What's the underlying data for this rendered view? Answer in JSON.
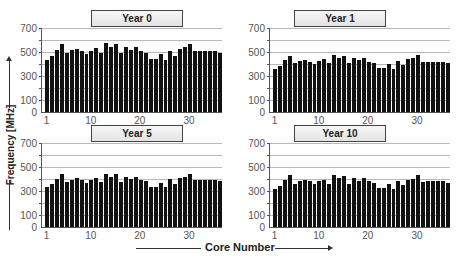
{
  "chart_data": [
    {
      "type": "bar",
      "title": "Year 0",
      "xlabel": "Core Number",
      "ylabel": "Frequency [MHz]",
      "ylim": [
        0,
        700
      ],
      "yticks": [
        0,
        100,
        300,
        500,
        700
      ],
      "xticks": [
        1,
        10,
        20,
        30
      ],
      "grid": true,
      "categories": [
        1,
        2,
        3,
        4,
        5,
        6,
        7,
        8,
        9,
        10,
        11,
        12,
        13,
        14,
        15,
        16,
        17,
        18,
        19,
        20,
        21,
        22,
        23,
        24,
        25,
        26,
        27,
        28,
        29,
        30,
        31,
        32,
        33,
        34,
        35,
        36
      ],
      "values": [
        430,
        465,
        520,
        570,
        490,
        515,
        525,
        505,
        485,
        510,
        530,
        490,
        575,
        540,
        565,
        490,
        545,
        515,
        545,
        505,
        495,
        440,
        440,
        480,
        435,
        510,
        470,
        525,
        540,
        570,
        505,
        510,
        505,
        505,
        510,
        495
      ]
    },
    {
      "type": "bar",
      "title": "Year 1",
      "xlabel": "Core Number",
      "ylabel": "Frequency [MHz]",
      "ylim": [
        0,
        700
      ],
      "yticks": [
        0,
        100,
        300,
        500,
        700
      ],
      "xticks": [
        1,
        10,
        20,
        30
      ],
      "grid": true,
      "categories": [
        1,
        2,
        3,
        4,
        5,
        6,
        7,
        8,
        9,
        10,
        11,
        12,
        13,
        14,
        15,
        16,
        17,
        18,
        19,
        20,
        21,
        22,
        23,
        24,
        25,
        26,
        27,
        28,
        29,
        30,
        31,
        32,
        33,
        34,
        35,
        36
      ],
      "values": [
        360,
        385,
        430,
        470,
        405,
        425,
        435,
        420,
        400,
        425,
        440,
        405,
        475,
        450,
        470,
        405,
        450,
        430,
        450,
        420,
        410,
        365,
        365,
        400,
        360,
        425,
        390,
        440,
        450,
        475,
        420,
        420,
        420,
        420,
        420,
        410
      ]
    },
    {
      "type": "bar",
      "title": "Year 5",
      "xlabel": "Core Number",
      "ylabel": "Frequency [MHz]",
      "ylim": [
        0,
        700
      ],
      "yticks": [
        0,
        100,
        300,
        500,
        700
      ],
      "xticks": [
        1,
        10,
        20,
        30
      ],
      "grid": true,
      "categories": [
        1,
        2,
        3,
        4,
        5,
        6,
        7,
        8,
        9,
        10,
        11,
        12,
        13,
        14,
        15,
        16,
        17,
        18,
        19,
        20,
        21,
        22,
        23,
        24,
        25,
        26,
        27,
        28,
        29,
        30,
        31,
        32,
        33,
        34,
        35,
        36
      ],
      "values": [
        335,
        360,
        400,
        445,
        375,
        395,
        405,
        395,
        370,
        395,
        410,
        375,
        445,
        420,
        440,
        375,
        420,
        400,
        420,
        395,
        385,
        335,
        335,
        370,
        330,
        400,
        360,
        410,
        415,
        445,
        390,
        395,
        395,
        395,
        395,
        385
      ]
    },
    {
      "type": "bar",
      "title": "Year 10",
      "xlabel": "Core Number",
      "ylabel": "Frequency [MHz]",
      "ylim": [
        0,
        700
      ],
      "yticks": [
        0,
        100,
        300,
        500,
        700
      ],
      "xticks": [
        1,
        10,
        20,
        30
      ],
      "grid": true,
      "categories": [
        1,
        2,
        3,
        4,
        5,
        6,
        7,
        8,
        9,
        10,
        11,
        12,
        13,
        14,
        15,
        16,
        17,
        18,
        19,
        20,
        21,
        22,
        23,
        24,
        25,
        26,
        27,
        28,
        29,
        30,
        31,
        32,
        33,
        34,
        35,
        36
      ],
      "values": [
        320,
        345,
        390,
        430,
        360,
        380,
        390,
        380,
        360,
        380,
        395,
        360,
        430,
        405,
        425,
        360,
        405,
        385,
        405,
        380,
        370,
        325,
        325,
        360,
        320,
        385,
        350,
        395,
        400,
        430,
        375,
        380,
        380,
        380,
        380,
        370
      ]
    }
  ],
  "labels": {
    "ylabel": "Frequency [MHz]",
    "xlabel": "Core Number"
  },
  "colors": {
    "bar": "#111111",
    "grid": "#b8b8b8",
    "axis": "#555555",
    "title_box": "#eeeeee"
  }
}
